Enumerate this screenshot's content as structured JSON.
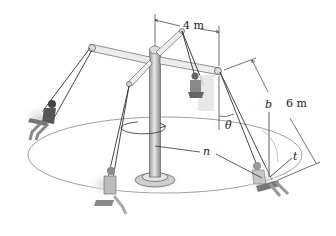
{
  "figure": {
    "labels": {
      "arm_length": "4 m",
      "rope_length": "6 m",
      "angle": "θ",
      "normal_axis": "n",
      "binormal_axis": "b",
      "tangent_axis": "t"
    },
    "colors": {
      "metal_light": "#e6e6e6",
      "metal_dark": "#8a8a8a",
      "rope": "#333333",
      "path_circle": "#777777",
      "shadow": "#d4d4d4",
      "rider_dark": "#555555",
      "rider_light": "#bdbdbd"
    }
  }
}
